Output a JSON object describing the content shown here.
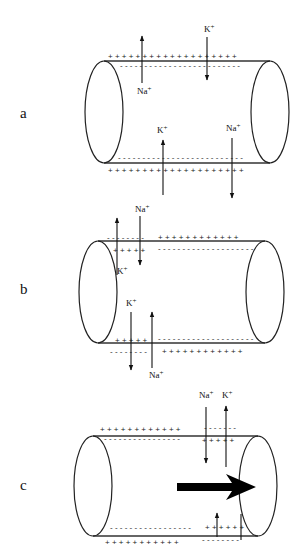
{
  "diagram": {
    "colors": {
      "line": "#222222",
      "background": "#ffffff",
      "big_arrow": "#000000"
    },
    "panels": [
      {
        "id": "a",
        "label": "a",
        "label_pos": [
          20,
          118
        ],
        "cylinder": {
          "left_cx": 104,
          "right_cx": 270,
          "cy": 112,
          "rx": 19,
          "ry": 51
        },
        "top_outer": [
          {
            "text": "+ + + + + + + + + + + + + + + + + + +",
            "x": 108,
            "y": 59
          }
        ],
        "top_inner": [
          {
            "text": "- - - - - - - - - - - - - - - - - - - - - - - - -",
            "x": 120,
            "y": 68
          }
        ],
        "bottom_inner": [
          {
            "text": "- - - - - - - - - - - - - - - - - - - - - - - - - -",
            "x": 118,
            "y": 160
          }
        ],
        "bottom_outer": [
          {
            "text": "+ + + + + + + + + + + + + + + + + + + +",
            "x": 108,
            "y": 173
          }
        ],
        "arrows": [
          {
            "x": 142,
            "y1": 83,
            "y2": 36,
            "dir": "up",
            "ion": "Na+",
            "lx": 137,
            "ly": 94
          },
          {
            "x": 207,
            "y1": 37,
            "y2": 80,
            "dir": "down",
            "ion": "K+",
            "lx": 204,
            "ly": 32
          },
          {
            "x": 163,
            "y1": 195,
            "y2": 140,
            "dir": "up",
            "ion": "K+",
            "lx": 157,
            "ly": 133
          },
          {
            "x": 232,
            "y1": 138,
            "y2": 198,
            "dir": "down",
            "ion": "Na+",
            "lx": 226,
            "ly": 131
          }
        ],
        "ions": {
          "na": "Na+",
          "k": "K+"
        }
      },
      {
        "id": "b",
        "label": "b",
        "label_pos": [
          20,
          294
        ],
        "cylinder": {
          "left_cx": 98,
          "right_cx": 265,
          "cy": 292,
          "rx": 19,
          "ry": 51
        },
        "top_outer": [
          {
            "text": "- - - - - - - -",
            "x": 107,
            "y": 240
          },
          {
            "text": "+ + + + + + + + + + + +",
            "x": 158,
            "y": 240
          }
        ],
        "top_inner": [
          {
            "text": "+ + + + +",
            "x": 113,
            "y": 253
          },
          {
            "text": "- - - - - - - - - - - - - - - - - - - -",
            "x": 158,
            "y": 251
          }
        ],
        "bottom_inner": [
          {
            "text": "+ + + + +",
            "x": 115,
            "y": 343
          },
          {
            "text": "- - - - - - - - - - - - - - - - - - - -",
            "x": 158,
            "y": 341
          }
        ],
        "bottom_outer": [
          {
            "text": "- - - - - - - -",
            "x": 110,
            "y": 354
          },
          {
            "text": "+ + + + + + + + + + + +",
            "x": 162,
            "y": 354
          }
        ],
        "arrows": [
          {
            "x": 117,
            "y1": 275,
            "y2": 218,
            "dir": "up",
            "ion": "K+",
            "lx": 117,
            "ly": 274
          },
          {
            "x": 140,
            "y1": 216,
            "y2": 265,
            "dir": "down",
            "ion": "Na+",
            "lx": 135,
            "ly": 212
          },
          {
            "x": 131,
            "y1": 312,
            "y2": 370,
            "dir": "down",
            "ion": "K+",
            "lx": 126,
            "ly": 306
          },
          {
            "x": 152,
            "y1": 368,
            "y2": 312,
            "dir": "up",
            "ion": "Na+",
            "lx": 149,
            "ly": 378
          }
        ]
      },
      {
        "id": "c",
        "label": "c",
        "label_pos": [
          20,
          490
        ],
        "cylinder": {
          "left_cx": 93,
          "right_cx": 258,
          "cy": 486,
          "rx": 19,
          "ry": 50
        },
        "top_outer": [
          {
            "text": "+ + + + + + + + + + + +",
            "x": 100,
            "y": 432
          },
          {
            "text": "- - - - - - -",
            "x": 204,
            "y": 430
          }
        ],
        "top_inner": [
          {
            "text": "- - - - - - - - - - - - - - - -",
            "x": 104,
            "y": 441
          },
          {
            "text": "+ + + + +",
            "x": 202,
            "y": 443
          }
        ],
        "bottom_inner": [
          {
            "text": "- - - - - - - - - - - - - - - - -",
            "x": 110,
            "y": 530
          },
          {
            "text": "+ + + + + +",
            "x": 205,
            "y": 530
          }
        ],
        "bottom_outer": [
          {
            "text": "+ + + + + + + + + + +",
            "x": 105,
            "y": 545
          },
          {
            "text": "- - - - - - - -",
            "x": 202,
            "y": 542
          }
        ],
        "arrows": [
          {
            "x": 206,
            "y1": 407,
            "y2": 463,
            "dir": "down",
            "ion": "Na+",
            "lx": 199,
            "ly": 398
          },
          {
            "x": 226,
            "y1": 467,
            "y2": 406,
            "dir": "up",
            "ion": "K+",
            "lx": 222,
            "ly": 398
          },
          {
            "x": 217,
            "y1": 537,
            "y2": 513,
            "dir": "up",
            "ion": "",
            "lx": 0,
            "ly": 0
          }
        ],
        "tick_line": {
          "x": 241,
          "y1": 514,
          "y2": 540
        },
        "big_arrow": {
          "x1": 177,
          "x2": 256,
          "y": 487,
          "label": "direction of propagation"
        }
      }
    ]
  }
}
